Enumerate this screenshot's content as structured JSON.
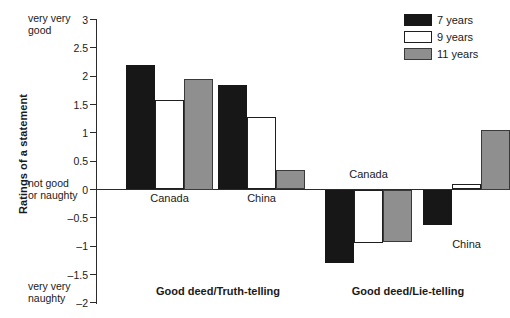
{
  "chart_data": {
    "type": "bar",
    "title": "",
    "xlabel": "",
    "ylabel": "Ratings of a statement",
    "ylim": [
      -2,
      3
    ],
    "yticks": [
      3,
      2.5,
      2,
      1.5,
      1,
      0.5,
      0,
      -0.5,
      -1,
      -1.5,
      -2
    ],
    "ytick_labels": [
      "3",
      "2.5",
      "2",
      "1.5",
      "1",
      "0.5",
      "0",
      "–0.5",
      "–1",
      "–1.5",
      "–2"
    ],
    "y_axis_annotations": [
      {
        "text": "very very\ngood",
        "value": 3
      },
      {
        "text": "not good\nor naughty",
        "value": 0
      },
      {
        "text": "very very\nnaughty",
        "value": -2
      }
    ],
    "grid": false,
    "legend_position": "top-right",
    "legend": [
      "7 years",
      "9 years",
      "11 years"
    ],
    "series": [
      {
        "name": "7 years",
        "color": "#171717",
        "values": [
          2.2,
          1.85,
          -1.3,
          -0.62
        ]
      },
      {
        "name": "9 years",
        "color": "#ffffff",
        "values": [
          1.58,
          1.28,
          -0.95,
          0.1
        ]
      },
      {
        "name": "11 years",
        "color": "#8f8f8f",
        "values": [
          1.95,
          0.35,
          -0.93,
          1.05
        ]
      }
    ],
    "categories": [
      "Canada",
      "China",
      "Canada",
      "China"
    ],
    "groups": [
      {
        "label": "Good deed/Truth-telling",
        "categories": [
          "Canada",
          "China"
        ]
      },
      {
        "label": "Good deed/Lie-telling",
        "categories": [
          "Canada",
          "China"
        ]
      }
    ]
  },
  "colors": {
    "series_7_years": "#171717",
    "series_9_years": "#ffffff",
    "series_11_years": "#8f8f8f",
    "axis": "#2b2b2b",
    "text": "#1a1a1a",
    "background": "#ffffff"
  }
}
